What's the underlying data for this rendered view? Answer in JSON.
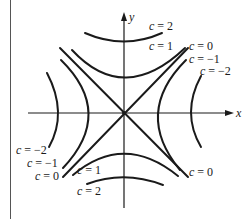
{
  "diagram": {
    "title": "",
    "axes": {
      "x_label": "x",
      "y_label": "y"
    },
    "colors": {
      "stroke": "#1a1a1a",
      "background": "#ffffff"
    },
    "curves": [
      {
        "c": 2,
        "branch": "top",
        "d": "M85,33 Q124,50 162,33"
      },
      {
        "c": 1,
        "branch": "top",
        "d": "M72,50 Q124,106 185,48"
      },
      {
        "c": 0,
        "branch": "diag1",
        "d": "M60,48 L188,177"
      },
      {
        "c": 0,
        "branch": "diag2",
        "d": "M188,48 L63,177"
      },
      {
        "c": -1,
        "branch": "left",
        "d": "M61,60 Q115,113 63,168"
      },
      {
        "c": -2,
        "branch": "left",
        "d": "M47,73 Q68,113 49,147"
      },
      {
        "c": -1,
        "branch": "right",
        "d": "M186,60 Q133,113 180,170"
      },
      {
        "c": -2,
        "branch": "right",
        "d": "M201,76 Q181,113 201,147"
      },
      {
        "c": 1,
        "branch": "bottom",
        "d": "M73,175 Q124,132 178,176"
      },
      {
        "c": 2,
        "branch": "bottom",
        "d": "M87,184 Q124,170 163,185"
      }
    ],
    "labels": [
      {
        "id": "top-c2",
        "text": "c = 2",
        "x": 149,
        "y": 20
      },
      {
        "id": "top-c1",
        "text": "c = 1",
        "x": 149,
        "y": 40
      },
      {
        "id": "top-c0",
        "text": "c = 0",
        "x": 189,
        "y": 40
      },
      {
        "id": "top-cm1",
        "text": "c = −1",
        "x": 189,
        "y": 53
      },
      {
        "id": "top-cm2",
        "text": "c = −2",
        "x": 200,
        "y": 65
      },
      {
        "id": "bot-cm2",
        "text": "c = −2",
        "x": 16,
        "y": 144
      },
      {
        "id": "bot-cm1",
        "text": "c = −1",
        "x": 27,
        "y": 157
      },
      {
        "id": "bot-c0-left",
        "text": "c = 0",
        "x": 35,
        "y": 170
      },
      {
        "id": "bot-c1",
        "text": "c = 1",
        "x": 77,
        "y": 164
      },
      {
        "id": "bot-c0-right",
        "text": "c = 0",
        "x": 189,
        "y": 166
      },
      {
        "id": "bot-c2",
        "text": "c = 2",
        "x": 77,
        "y": 185
      }
    ]
  }
}
